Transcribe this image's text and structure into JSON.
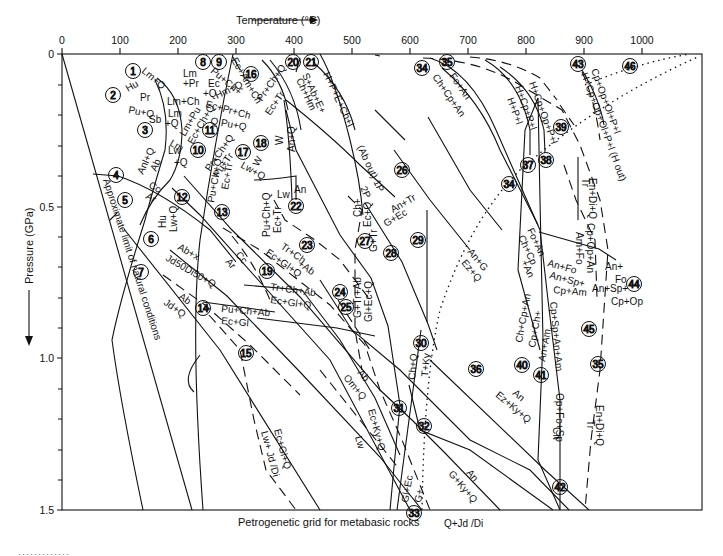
{
  "figure": {
    "caption": "Petrogenetic grid for metabasic rocks",
    "x_axis_title": "Temperature (°C)",
    "y_axis_title": "Pressure (GPa)",
    "x_ticks": [
      "0",
      "100",
      "200",
      "300",
      "400",
      "500",
      "600",
      "700",
      "800",
      "900",
      "1000"
    ],
    "y_ticks": [
      "0",
      "0.5",
      "1.0",
      "1.5"
    ],
    "side_note": "Approximate limit of natural conditions",
    "bottom_label": "Q+Jd /Di",
    "footer_rule": "·············"
  },
  "reaction_numbers": [
    "1",
    "2",
    "3",
    "4",
    "5",
    "6",
    "7",
    "8",
    "9",
    "10",
    "11",
    "12",
    "13",
    "14",
    "15",
    "16",
    "17",
    "18",
    "19",
    "20",
    "21",
    "22",
    "23",
    "24",
    "25",
    "26",
    "27",
    "28",
    "29",
    "30",
    "31",
    "32",
    "33",
    "34",
    "35",
    "36",
    "37",
    "38",
    "39",
    "40",
    "41",
    "42",
    "43",
    "44",
    "45",
    "46"
  ],
  "labels": {
    "l1a": "Lm+Q",
    "l1b": "Hu",
    "l2a": "Pr",
    "l2b": "Pu+Q",
    "l3a": "Sb",
    "l3b": "+Q",
    "l_lmch": "Lm+Ch",
    "l_lm": "Lm",
    "l8a": "Lm",
    "l8b": "+Pr",
    "l8c": "Ec",
    "l8d": "+Q",
    "l9a": "Pu+Ch+",
    "l9b": "Hm+Q",
    "l_ecamch": "Ec+Am+Ch",
    "l_ecprch": "Ec+Pr+Ch",
    "l_qpuq": "Q Pu+Q",
    "l10a": "Lm+Pu",
    "l10b": "Ec+Ch+Q",
    "l10c": "Lm",
    "l_lw": "Lw",
    "l_q": "+Q",
    "l4a": "Anl+Q",
    "l4b": "Ab",
    "l_cc1": "Cc",
    "l_ar1": "Ar",
    "l_hu": "Hu",
    "l_lwq": "Lw+Q",
    "l12a": "Pu+Ch+Q",
    "l12b": "Ec+Tr",
    "l17a": "Pr+Ch+Q",
    "l17b": "Pu+Tr",
    "l16a": "Pr+Ch+Q",
    "l16b": "Ec+Tr",
    "l_w1": "W",
    "l_lwq2": "Lw+Q",
    "l_w2": "W",
    "l_anq": "An+Q",
    "l_lw2": "Lw",
    "l_an": "An",
    "l13a": "Pu+Ch+Q",
    "l13b": "Ec+Tr",
    "l21a": "S+Ab+E+",
    "l21b": "Ch+Hm",
    "l_hpe": "H+P+E+Ch+l",
    "l_about": "(Ab out)  1P",
    "l_2p": "2P",
    "l6a": "Ab+x",
    "l6b": "Jd50Di50+Q",
    "l7a": "Ab",
    "l7b": "Jd+Q",
    "l_cc2": "Cc",
    "l_ar2": "Ar",
    "l23a": "Tr+Ch",
    "l23b": "+Ab",
    "l23c": "Ec+Gl+Q",
    "l19a": "Tr+Ch+Ab",
    "l19b": "Ec+Gl+Q",
    "l14a": "Pu+Ch+Ab",
    "l14b": "Ec+Gl",
    "l27a": "Ch+",
    "l27b": "Ec+Q",
    "l_gtr": "G+Tr",
    "l29a": "An+Tr",
    "l29b": "G+Ec",
    "l25a": "G+Tr+Ab",
    "l25b": "Gl+Ec+Q",
    "l_ang": "An+G",
    "l_ezq": "Ez+Q",
    "l_abom1": "Ab",
    "l_abom2": "Om+Q",
    "l_eckyq": "Ec+Ky+Q",
    "l_lw3": "Lw",
    "l_chq": "Ch+Q",
    "l_tky": "T+Ky",
    "l_glec": "Gl+Ec",
    "l_g": "G+",
    "l_an2": "An",
    "l_gkyq": "G+Ky+Q",
    "l_an3": "An",
    "l_ezkyq": "Ez+Ky+Q",
    "l15a": "Ec+Gl+Q",
    "l15b": "Lw+ Jd /Di",
    "l34a": "Fo+An",
    "l34b": "Ch+Cp+An",
    "l37": "H+P+l",
    "l37b": "H+Cp+P+l",
    "l38": "H+Cp+Op+P+l",
    "l43a": "Cp+Op+Ol+P+l",
    "l43b": "H+Cp+Op+Ol+P+l  (H out)",
    "l_endiq1": "En+Di+Q",
    "l_tr1": "Tr",
    "l_cpopan": "Cp+Op+An",
    "l_amfo": "Am+Fo",
    "l_fo2a": "Fo+An",
    "l_chcp": "Ch+Cp",
    "l_pan": "+An",
    "l_anfo": "An+Fo",
    "l_anspcpam1": "An+Sp+",
    "l_anspcpam2": "Cp+Am",
    "l44a": "An+",
    "l44b": "Fo",
    "l44c": "An+Sp+",
    "l44d": "Cp+Op",
    "l40a": "Ch+Cp+An",
    "l40b": "Cp+Ch+",
    "l40c": "An+Am",
    "l_cpspanam": "Cp+Sp+An+Am",
    "l_ch": "Ch",
    "l_opfosp": "Op+Fo+Sp",
    "l_endiq2": "En+Di+Q",
    "l_tr2": "Tr"
  }
}
